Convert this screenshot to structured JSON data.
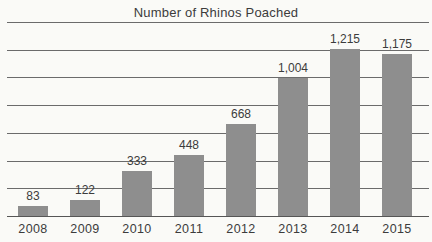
{
  "chart_data": {
    "type": "bar",
    "title": "Number of Rhinos Poached",
    "categories": [
      "2008",
      "2009",
      "2010",
      "2011",
      "2012",
      "2013",
      "2014",
      "2015"
    ],
    "values": [
      83,
      122,
      333,
      448,
      668,
      1004,
      1215,
      1175
    ],
    "value_labels": [
      "83",
      "122",
      "333",
      "448",
      "668",
      "1,004",
      "1,215",
      "1,175"
    ],
    "xlabel": "",
    "ylabel": "",
    "ylim": [
      0,
      1400
    ],
    "gridline_step": 200,
    "grid": "horizontal-only",
    "y_tick_labels_shown": false,
    "legend_position": "none",
    "bar_color": "#8e8e8e",
    "gridline_color": "#6b6b6b",
    "baseline_color": "#565656",
    "text_color": "#3c3c3c",
    "background_color": "#fafaf7"
  }
}
